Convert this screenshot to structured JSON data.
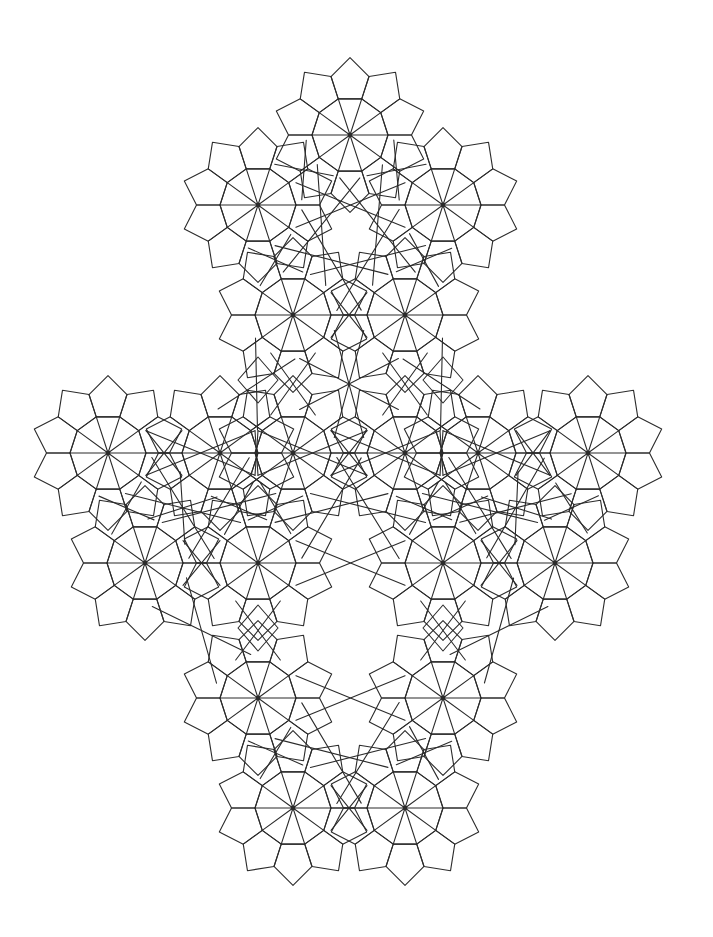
{
  "artwork": {
    "title": "Ten-Pointed Rosette Tessellation",
    "type": "islamic-geometric-tiling",
    "canvas": {
      "width": 713,
      "height": 937,
      "background": "#ffffff"
    },
    "stroke": {
      "color": "#2b2b2b",
      "width": 1.1,
      "linejoin": "round",
      "linecap": "round"
    },
    "motif": {
      "name": "ten-pointed-rosette",
      "spoke_count": 10,
      "inner_decagon_radius": 38,
      "star_point_radius": 66,
      "pentagon_ring": true,
      "center_dot_radius": 2.4
    },
    "lattice": {
      "description": "Rosette centres on a rhombic lattice; horizontal step 185, diagonal step 110 x 110",
      "step_x": 185,
      "step_y": 110,
      "half_step_x": 92.5,
      "centers": [
        {
          "x": 350,
          "y": 135
        },
        {
          "x": 258,
          "y": 205
        },
        {
          "x": 443,
          "y": 205
        },
        {
          "x": 293,
          "y": 315
        },
        {
          "x": 405,
          "y": 315
        },
        {
          "x": 108,
          "y": 453
        },
        {
          "x": 220,
          "y": 453
        },
        {
          "x": 293,
          "y": 453
        },
        {
          "x": 405,
          "y": 453
        },
        {
          "x": 478,
          "y": 453
        },
        {
          "x": 588,
          "y": 453
        },
        {
          "x": 145,
          "y": 563
        },
        {
          "x": 258,
          "y": 563
        },
        {
          "x": 443,
          "y": 563
        },
        {
          "x": 555,
          "y": 563
        },
        {
          "x": 258,
          "y": 698
        },
        {
          "x": 443,
          "y": 698
        },
        {
          "x": 293,
          "y": 808
        },
        {
          "x": 405,
          "y": 808
        }
      ]
    },
    "filler_rhombi": [
      {
        "x": 258,
        "y": 380,
        "w": 40,
        "h": 46
      },
      {
        "x": 443,
        "y": 380,
        "w": 40,
        "h": 46
      },
      {
        "x": 258,
        "y": 628,
        "w": 40,
        "h": 46
      },
      {
        "x": 443,
        "y": 628,
        "w": 40,
        "h": 46
      }
    ],
    "bounds": {
      "x_min": 35,
      "x_max": 678,
      "y_min": 36,
      "y_max": 896
    }
  }
}
